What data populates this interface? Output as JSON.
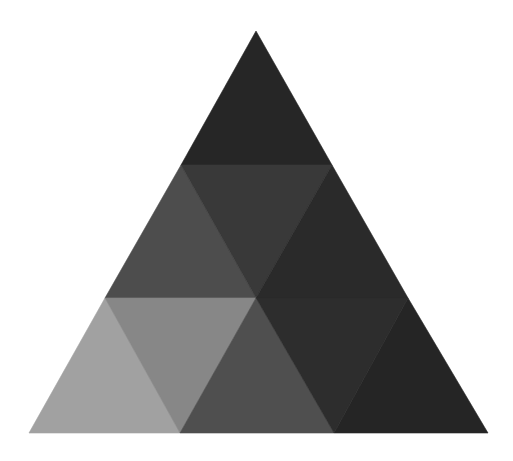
{
  "diagram": {
    "type": "triangular-tiling",
    "canvas": {
      "width": 513,
      "height": 461,
      "background": "#ffffff"
    },
    "tiles": [
      {
        "id": "top",
        "row": 1,
        "orientation": "up",
        "points": [
          [
            256,
            31
          ],
          [
            181,
            165
          ],
          [
            332,
            165
          ]
        ],
        "fill": "#262626"
      },
      {
        "id": "row2-left",
        "row": 2,
        "orientation": "up",
        "points": [
          [
            181,
            165
          ],
          [
            105,
            298
          ],
          [
            256,
            298
          ]
        ],
        "fill": "#4d4d4d"
      },
      {
        "id": "row2-center",
        "row": 2,
        "orientation": "down",
        "points": [
          [
            181,
            165
          ],
          [
            332,
            165
          ],
          [
            256,
            298
          ]
        ],
        "fill": "#393939"
      },
      {
        "id": "row2-right",
        "row": 2,
        "orientation": "up",
        "points": [
          [
            332,
            165
          ],
          [
            256,
            298
          ],
          [
            408,
            298
          ]
        ],
        "fill": "#2a2a2a"
      },
      {
        "id": "row3-1",
        "row": 3,
        "orientation": "up",
        "points": [
          [
            105,
            298
          ],
          [
            29,
            433
          ],
          [
            180,
            433
          ]
        ],
        "fill": "#a1a1a1"
      },
      {
        "id": "row3-2",
        "row": 3,
        "orientation": "down",
        "points": [
          [
            105,
            298
          ],
          [
            256,
            298
          ],
          [
            180,
            433
          ]
        ],
        "fill": "#878787"
      },
      {
        "id": "row3-3",
        "row": 3,
        "orientation": "up",
        "points": [
          [
            256,
            298
          ],
          [
            180,
            433
          ],
          [
            334,
            433
          ]
        ],
        "fill": "#4f4f4f"
      },
      {
        "id": "row3-4",
        "row": 3,
        "orientation": "down",
        "points": [
          [
            256,
            298
          ],
          [
            408,
            298
          ],
          [
            334,
            433
          ]
        ],
        "fill": "#2d2d2d"
      },
      {
        "id": "row3-5",
        "row": 3,
        "orientation": "up",
        "points": [
          [
            408,
            298
          ],
          [
            334,
            433
          ],
          [
            488,
            433
          ]
        ],
        "fill": "#252525"
      }
    ]
  }
}
